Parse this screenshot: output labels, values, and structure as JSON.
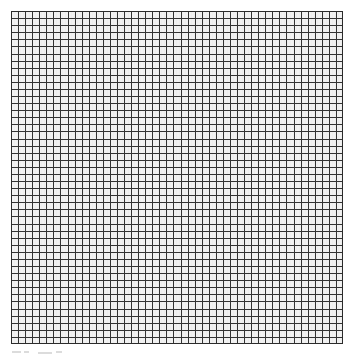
{
  "canvas": {
    "width": 356,
    "height": 358,
    "background_color": "#ffffff"
  },
  "figure": {
    "name": "square-mesh-grid",
    "x": 11,
    "y": 11,
    "width": 332,
    "height": 333,
    "columns": 47,
    "rows": 47,
    "cell_pitch_px": 7.06,
    "line_color": "#333333",
    "line_width_px": 1,
    "cell_fill_color": "#f2f2f2",
    "border_color": "#2b2b2b",
    "border_width_px": 1
  },
  "artifacts": {
    "label": "faint gray marks below grid",
    "color": "#dcdcdc",
    "marks": [
      {
        "x": 12,
        "y": 351,
        "width": 9
      },
      {
        "x": 24,
        "y": 351,
        "width": 5
      },
      {
        "x": 38,
        "y": 352,
        "width": 14
      },
      {
        "x": 56,
        "y": 351,
        "width": 6
      }
    ]
  },
  "chart_data": {
    "type": "heatmap",
    "title": "",
    "subtitle": "",
    "xlabel": "",
    "ylabel": "",
    "grid": true,
    "legend": "none",
    "x_tick_labels": [],
    "y_tick_labels": [],
    "xlim": [
      0,
      47
    ],
    "ylim": [
      0,
      47
    ],
    "columns": 47,
    "rows": 47,
    "uniform_value": 1,
    "note": "Uniform blank square-mesh grid; every cell has identical fill (#f2f2f2) separated by dark gridlines (#333333). No data values, labels, ticks, or legend are rendered."
  }
}
